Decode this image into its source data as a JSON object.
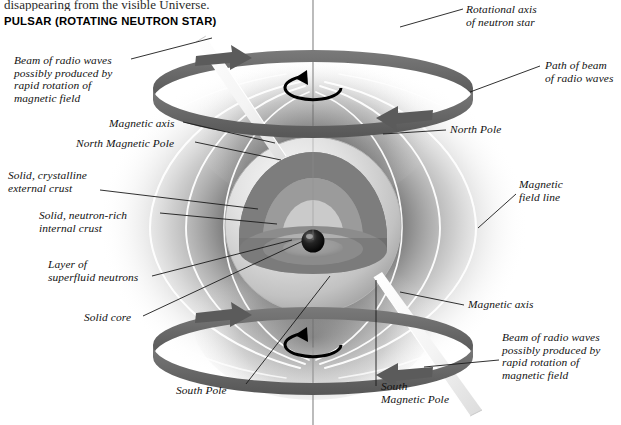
{
  "page": {
    "cut_off_line": "disappearing from the visible Universe.",
    "title": "PULSAR (ROTATING NEUTRON STAR)",
    "background": "#ffffff",
    "ink": "#111111"
  },
  "colors": {
    "ring_band": "#6c6c6c",
    "ring_band_dark": "#4f4f4f",
    "field_line": "#ffffff",
    "glow_dark": "#3b3b3b",
    "star_body": "#d8d8d8",
    "crust_outer": "#8e8e8e",
    "crust_inner": "#9f9f9f",
    "superfluid": "#cfcfcf",
    "core": "#141414",
    "beam": "#f2f2f2",
    "leader": "#1a1a1a"
  },
  "labels": [
    {
      "id": "beam-top",
      "text": "Beam of radio waves\npossibly produced by\nrapid rotation of\nmagnetic field",
      "x": 14,
      "y": 54,
      "align": "left"
    },
    {
      "id": "magnetic-axis-top",
      "text": "Magnetic axis",
      "x": 109,
      "y": 117,
      "align": "left"
    },
    {
      "id": "north-magnetic-pole",
      "text": "North Magnetic Pole",
      "x": 76,
      "y": 137,
      "align": "left"
    },
    {
      "id": "external-crust",
      "text": "Solid, crystalline\nexternal crust",
      "x": 8,
      "y": 169,
      "align": "left"
    },
    {
      "id": "internal-crust",
      "text": "Solid, neutron-rich\ninternal crust",
      "x": 39,
      "y": 209,
      "align": "left"
    },
    {
      "id": "superfluid-layer",
      "text": "Layer of\nsuperfluid neutrons",
      "x": 48,
      "y": 258,
      "align": "left"
    },
    {
      "id": "solid-core",
      "text": "Solid core",
      "x": 84,
      "y": 314,
      "align": "left"
    },
    {
      "id": "rotational-axis",
      "text": "Rotational axis\nof neutron star",
      "x": 466,
      "y": 3,
      "align": "left"
    },
    {
      "id": "path-of-beam",
      "text": "Path of beam\nof radio waves",
      "x": 545,
      "y": 59,
      "align": "left"
    },
    {
      "id": "north-pole",
      "text": "North Pole",
      "x": 450,
      "y": 125,
      "align": "left"
    },
    {
      "id": "magnetic-field-line",
      "text": "Magnetic\nfield line",
      "x": 519,
      "y": 180,
      "align": "left"
    },
    {
      "id": "magnetic-axis-bottom",
      "text": "Magnetic axis",
      "x": 468,
      "y": 300,
      "align": "left"
    },
    {
      "id": "beam-bottom",
      "text": "Beam of radio waves\npossibly produced by\nrapid rotation of\nmagnetic field",
      "x": 502,
      "y": 331,
      "align": "left"
    },
    {
      "id": "south-pole",
      "text": "South Pole",
      "x": 176,
      "y": 386,
      "align": "left"
    },
    {
      "id": "south-magnetic-pole",
      "text": "South\nMagnetic Pole",
      "x": 381,
      "y": 382,
      "align": "left"
    }
  ],
  "diagram": {
    "object": "pulsar (rotating neutron star)",
    "star_center": {
      "x": 313,
      "y": 225
    },
    "star_radius": 88,
    "rotational_axis": {
      "x": 313,
      "top": 0,
      "bottom": 425
    },
    "rings": [
      {
        "id": "upper-beam-path-ring",
        "cx": 313,
        "cy": 88,
        "rx": 160,
        "ry": 38
      },
      {
        "id": "lower-beam-path-ring",
        "cx": 313,
        "cy": 345,
        "rx": 160,
        "ry": 38
      }
    ],
    "spin_arrows": [
      {
        "id": "spin-arrow-top",
        "cx": 313,
        "cy": 88,
        "rx": 28,
        "ry": 12,
        "direction": "counterclockwise"
      },
      {
        "id": "spin-arrow-bottom",
        "cx": 313,
        "cy": 345,
        "rx": 28,
        "ry": 12,
        "direction": "counterclockwise"
      }
    ],
    "beams": [
      {
        "id": "beam-cone-north",
        "from": "north magnetic pole",
        "direction": "upper-left"
      },
      {
        "id": "beam-cone-south",
        "from": "south magnetic pole",
        "direction": "lower-right"
      }
    ],
    "interior_layers": [
      "Solid, crystalline external crust",
      "Solid, neutron-rich internal crust",
      "Layer of superfluid neutrons",
      "Solid core"
    ]
  }
}
